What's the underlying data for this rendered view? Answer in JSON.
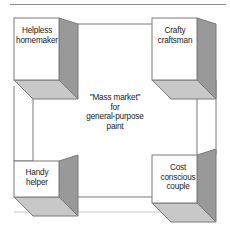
{
  "figure": {
    "name": "mass-market-paint-segmentation-diagram",
    "background_color": "#ffffff",
    "rule_color": "#8a8a8a",
    "text_color": "#1a1a1a",
    "line_color": "#7a7a7a",
    "box_face_color": "#ffffff",
    "box_side_color": "#999999",
    "box_bottom_color": "#c8c8c8"
  },
  "center": {
    "text": "\"Mass market\"\nfor\ngeneral-purpose\npaint",
    "line1": "\"Mass market\"",
    "line2": "for",
    "line3": "general-purpose",
    "line4": "paint"
  },
  "segments": [
    {
      "id": "top-left",
      "position": "top-left",
      "label": "Helpless\nhomemaker",
      "line1": "Helpless",
      "line2": "homemaker"
    },
    {
      "id": "top-right",
      "position": "top-right",
      "label": "Crafty\ncraftsman",
      "line1": "Crafty",
      "line2": "craftsman"
    },
    {
      "id": "bottom-left",
      "position": "bottom-left",
      "label": "Handy\nhelper",
      "line1": "Handy",
      "line2": "helper"
    },
    {
      "id": "bottom-right",
      "position": "bottom-right",
      "label": "Cost\nconscious\ncouple",
      "line1": "Cost",
      "line2": "conscious",
      "line3": "couple"
    }
  ]
}
